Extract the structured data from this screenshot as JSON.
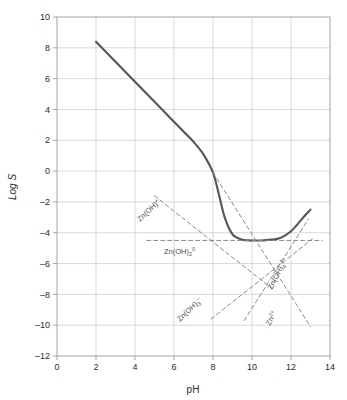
{
  "figure": {
    "background_color": "#ffffff",
    "frame_color": "#9a9a9a",
    "grid_color": "#c9c9c9",
    "curve_color": "#555555",
    "dashed_color": "#8a8a8a",
    "text_color": "#2b2b2b"
  },
  "chart_data": {
    "type": "line",
    "title": "",
    "subtitle": "",
    "xlabel": "pH",
    "ylabel": "Log S",
    "xlim": [
      0,
      14
    ],
    "ylim": [
      -12,
      10
    ],
    "xticks": [
      0,
      2,
      4,
      6,
      8,
      10,
      12,
      14
    ],
    "yticks": [
      10,
      8,
      6,
      4,
      2,
      0,
      -2,
      -4,
      -6,
      -8,
      -10,
      -12
    ],
    "xtick_labels": [
      "0",
      "2",
      "4",
      "6",
      "8",
      "10",
      "12",
      "14"
    ],
    "ytick_labels": [
      "10",
      "8",
      "6",
      "4",
      "2",
      "0",
      "–2",
      "–4",
      "–6",
      "–8",
      "–10",
      "–12"
    ],
    "grid": true,
    "legend": "none",
    "series": [
      {
        "name": "Total Zn solubility",
        "style": "solid",
        "color": "#555555",
        "x": [
          2.0,
          2.5,
          3.0,
          3.5,
          4.0,
          4.5,
          5.0,
          5.5,
          6.0,
          6.5,
          7.0,
          7.5,
          8.0,
          8.3,
          8.6,
          9.0,
          9.5,
          10.0,
          10.5,
          11.0,
          11.3,
          11.6,
          12.0,
          12.3,
          12.6,
          13.0
        ],
        "y": [
          8.4,
          7.75,
          7.1,
          6.45,
          5.8,
          5.15,
          4.5,
          3.85,
          3.2,
          2.55,
          1.9,
          1.1,
          -0.1,
          -1.5,
          -3.0,
          -4.1,
          -4.45,
          -4.5,
          -4.5,
          -4.45,
          -4.4,
          -4.25,
          -3.9,
          -3.5,
          -3.05,
          -2.5
        ]
      },
      {
        "name": "Zn2+",
        "style": "dashed",
        "color": "#8a8a8a",
        "x": [
          8.0,
          13.0
        ],
        "y": [
          -0.1,
          -10.1
        ]
      },
      {
        "name": "Zn(OH)+",
        "style": "dashed",
        "color": "#8a8a8a",
        "x": [
          5.0,
          11.0
        ],
        "y": [
          -1.6,
          -7.6
        ]
      },
      {
        "name": "Zn(OH)2 aq",
        "style": "dashed",
        "color": "#8a8a8a",
        "x": [
          4.6,
          13.6
        ],
        "y": [
          -4.5,
          -4.5
        ]
      },
      {
        "name": "Zn(OH)3-",
        "style": "dashed",
        "color": "#8a8a8a",
        "x": [
          7.9,
          13.1
        ],
        "y": [
          -9.6,
          -4.4
        ]
      },
      {
        "name": "Zn(OH)4 2-",
        "style": "dashed",
        "color": "#8a8a8a",
        "x": [
          9.6,
          12.9
        ],
        "y": [
          -9.7,
          -3.1
        ]
      }
    ],
    "annotations": [
      {
        "id": "zn-oh-plus",
        "text": "Zn(OH)",
        "sub": "",
        "sup": "+",
        "x_px": 140,
        "y_px": 222,
        "rotate": -43
      },
      {
        "id": "zn-oh-2-aq",
        "text": "Zn(OH)",
        "sub": "2",
        "sup": "0",
        "x_px": 164,
        "y_px": 254,
        "rotate": 0
      },
      {
        "id": "zn-oh-3-minus",
        "text": "Zn(OH)",
        "sub": "3",
        "sup": "–",
        "x_px": 180,
        "y_px": 322,
        "rotate": -44
      },
      {
        "id": "zn-oh-4-2minus",
        "text": "Zn(OH)",
        "sub": "4",
        "sup": "2–",
        "x_px": 272,
        "y_px": 290,
        "rotate": -63
      },
      {
        "id": "zn-2plus",
        "text": "Zn",
        "sub": "",
        "sup": "2+",
        "x_px": 270,
        "y_px": 326,
        "rotate": -62
      }
    ]
  }
}
